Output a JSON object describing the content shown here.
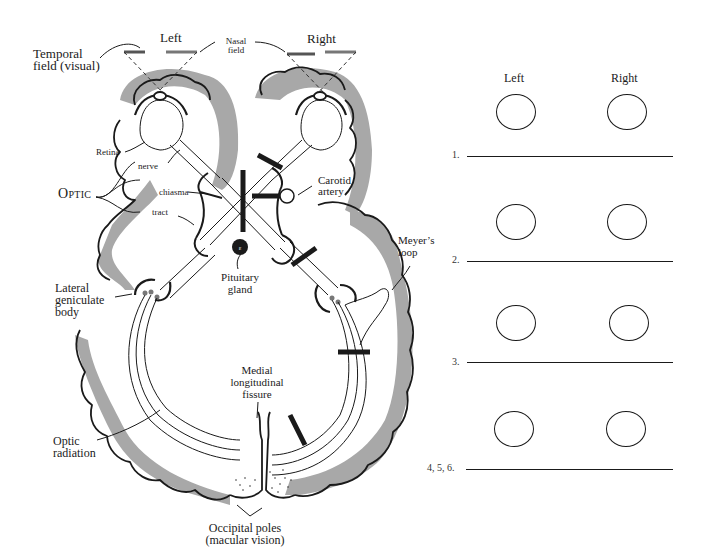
{
  "diagram": {
    "visual_field": {
      "left_label": "Left",
      "right_label": "Right",
      "temporal_label_1": "Temporal",
      "temporal_label_2": "field (visual)",
      "nasal_label_1": "Nasal",
      "nasal_label_2": "field"
    },
    "labels": {
      "retina": "Retina",
      "nerve": "nerve",
      "optic": "Optic",
      "chiasma": "chiasma",
      "tract": "tract",
      "carotid_1": "Carotid",
      "carotid_2": "artery",
      "pituitary_1": "Pituitary",
      "pituitary_2": "gland",
      "lgb_1": "Lateral",
      "lgb_2": "geniculate",
      "lgb_3": "body",
      "meyer_1": "Meyer’s",
      "meyer_2": "loop",
      "medial_1": "Medial",
      "medial_2": "longitudinal",
      "medial_3": "fissure",
      "radiation_1": "Optic",
      "radiation_2": "radiation",
      "occipital_1": "Occipital poles",
      "occipital_2": "(macular vision)"
    },
    "colors": {
      "ink": "#1a1a1a",
      "cortex_shade": "#a8a8a8",
      "field_bar": "#666666"
    }
  },
  "worksheet": {
    "header_left": "Left",
    "header_right": "Right",
    "rows": [
      {
        "number": "1.",
        "answer": ""
      },
      {
        "number": "2.",
        "answer": ""
      },
      {
        "number": "3.",
        "answer": ""
      },
      {
        "number": "4, 5, 6.",
        "answer": ""
      }
    ]
  }
}
